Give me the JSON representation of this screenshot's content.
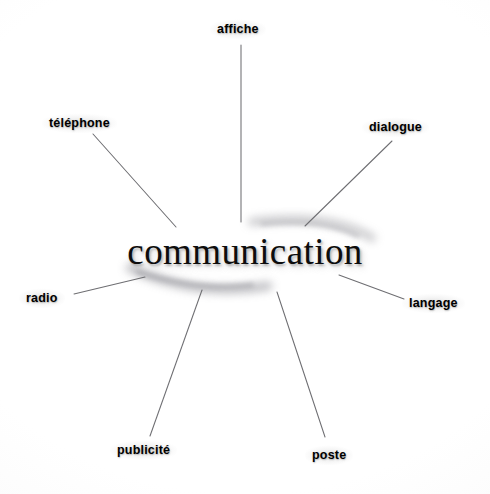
{
  "diagram": {
    "type": "mind-map",
    "title": "communication",
    "center": {
      "label": "communication",
      "x": 245,
      "y": 248
    },
    "background_color": "#fdfdfd",
    "line_color": "#6e6e72",
    "text_color": "#000000",
    "nodes": [
      {
        "id": "affiche",
        "label": "affiche",
        "label_x": 210,
        "label_y": 19,
        "line": {
          "x1": 241,
          "y1": 45,
          "x2": 241,
          "y2": 222
        }
      },
      {
        "id": "telephone",
        "label": "téléphone",
        "label_x": 42,
        "label_y": 113,
        "line": {
          "x1": 93,
          "y1": 134,
          "x2": 176,
          "y2": 227
        }
      },
      {
        "id": "dialogue",
        "label": "dialogue",
        "label_x": 362,
        "label_y": 117,
        "line": {
          "x1": 392,
          "y1": 141,
          "x2": 305,
          "y2": 226
        }
      },
      {
        "id": "langage",
        "label": "langage",
        "label_x": 402,
        "label_y": 293,
        "line": {
          "x1": 339,
          "y1": 275,
          "x2": 404,
          "y2": 299
        }
      },
      {
        "id": "poste",
        "label": "poste",
        "label_x": 305,
        "label_y": 445,
        "line": {
          "x1": 277,
          "y1": 292,
          "x2": 325,
          "y2": 437
        }
      },
      {
        "id": "publicite",
        "label": "publicité",
        "label_x": 110,
        "label_y": 440,
        "line": {
          "x1": 202,
          "y1": 290,
          "x2": 150,
          "y2": 436
        }
      },
      {
        "id": "radio",
        "label": "radio",
        "label_x": 19,
        "label_y": 288,
        "line": {
          "x1": 145,
          "y1": 277,
          "x2": 74,
          "y2": 294
        }
      }
    ]
  }
}
